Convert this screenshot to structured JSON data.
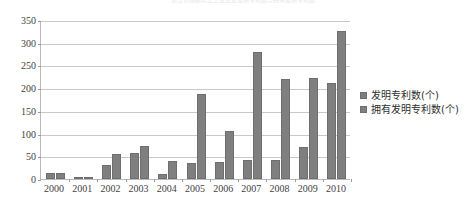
{
  "chart_data": {
    "type": "bar",
    "title": "浙江省规模以上工业企业发明专利数与拥有发明专利数",
    "xlabel": "",
    "ylabel": "",
    "ylim": [
      0,
      350
    ],
    "yticks": [
      0,
      50,
      100,
      150,
      200,
      250,
      300,
      350
    ],
    "ytick_labels": [
      "0",
      "50",
      "100",
      "150",
      "200",
      "250",
      "300",
      "350"
    ],
    "grid": true,
    "legend_position": "right",
    "categories": [
      "2000",
      "2001",
      "2002",
      "2003",
      "2004",
      "2005",
      "2006",
      "2007",
      "2008",
      "2009",
      "2010"
    ],
    "series": [
      {
        "name": "发明专利数(个)",
        "color": "#7f7f7f",
        "values": [
          13,
          3,
          30,
          58,
          12,
          35,
          38,
          42,
          42,
          70,
          212
        ]
      },
      {
        "name": "拥有发明专利数(个)",
        "color": "#7f7f7f",
        "values": [
          13,
          4,
          55,
          72,
          40,
          188,
          105,
          280,
          220,
          222,
          325
        ]
      }
    ]
  },
  "legend": {
    "items": [
      {
        "label": "发明专利数(个)"
      },
      {
        "label": "拥有发明专利数(个)"
      }
    ]
  }
}
